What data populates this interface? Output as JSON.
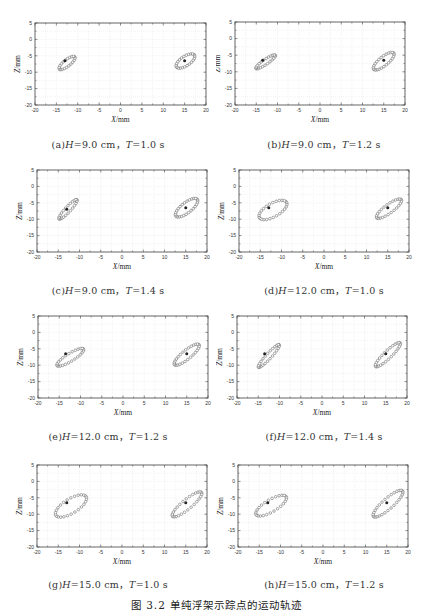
{
  "figure": {
    "caption": "图 3.2   单纯浮架示踪点的运动轨迹"
  },
  "chart_data": [
    {
      "id": "a",
      "type": "scatter",
      "label_prefix": "(a)",
      "H": "9.0 cm",
      "T": "1.0 s",
      "caption": "(a)H=9.0 cm, T=1.0 s",
      "xlabel": "X/mm",
      "ylabel": "Z/mm",
      "xlim": [
        -20,
        20
      ],
      "ylim": [
        -20,
        5
      ],
      "xticks": [
        -20,
        -15,
        -10,
        -5,
        0,
        5,
        10,
        15,
        20
      ],
      "yticks": [
        5,
        0,
        -5,
        -10,
        -15,
        -20
      ],
      "grid": true,
      "center_points": [
        [
          -13,
          -6.5
        ],
        [
          15,
          -6.5
        ]
      ],
      "series": [
        {
          "name": "left-trajectory",
          "loop": {
            "cx": -12.5,
            "cy": -7.2,
            "rx": 2.6,
            "ry": 0.9,
            "angle": -48,
            "n": 22
          }
        },
        {
          "name": "right-trajectory",
          "loop": {
            "cx": 15.2,
            "cy": -6.6,
            "rx": 2.8,
            "ry": 1.3,
            "angle": -45,
            "n": 24
          }
        }
      ]
    },
    {
      "id": "b",
      "type": "scatter",
      "label_prefix": "(b)",
      "H": "9.0 cm",
      "T": "1.2 s",
      "caption": "(b)H=9.0 cm, T=1.2 s",
      "xlabel": "X/mm",
      "ylabel": "Z/mm",
      "xlim": [
        -20,
        20
      ],
      "ylim": [
        -20,
        5
      ],
      "xticks": [
        -20,
        -15,
        -10,
        -5,
        0,
        5,
        10,
        15,
        20
      ],
      "yticks": [
        5,
        0,
        -5,
        -10,
        -15,
        -20
      ],
      "grid": true,
      "center_points": [
        [
          -13.5,
          -6.5
        ],
        [
          15,
          -6.5
        ]
      ],
      "series": [
        {
          "name": "left-trajectory",
          "loop": {
            "cx": -12.8,
            "cy": -7.0,
            "rx": 3.0,
            "ry": 0.7,
            "angle": -42,
            "n": 24
          }
        },
        {
          "name": "right-trajectory",
          "loop": {
            "cx": 15.0,
            "cy": -6.8,
            "rx": 3.4,
            "ry": 1.2,
            "angle": -48,
            "n": 26
          }
        }
      ]
    },
    {
      "id": "c",
      "type": "scatter",
      "label_prefix": "(c)",
      "H": "9.0 cm",
      "T": "1.4 s",
      "caption": "(c)H=9.0 cm, T=1.4 s",
      "xlabel": "X/mm",
      "ylabel": "Z/mm",
      "xlim": [
        -20,
        20
      ],
      "ylim": [
        -20,
        5
      ],
      "xticks": [
        -20,
        -15,
        -10,
        -5,
        0,
        5,
        10,
        15,
        20
      ],
      "yticks": [
        5,
        0,
        -5,
        -10,
        -15,
        -20
      ],
      "grid": true,
      "center_points": [
        [
          -13,
          -7
        ],
        [
          15,
          -6.5
        ]
      ],
      "series": [
        {
          "name": "left-trajectory",
          "loop": {
            "cx": -12.7,
            "cy": -7.0,
            "rx": 3.6,
            "ry": 0.7,
            "angle": -55,
            "n": 24
          }
        },
        {
          "name": "right-trajectory",
          "loop": {
            "cx": 15.2,
            "cy": -6.5,
            "rx": 3.6,
            "ry": 1.4,
            "angle": -48,
            "n": 28
          }
        }
      ]
    },
    {
      "id": "d",
      "type": "scatter",
      "label_prefix": "(d)",
      "H": "12.0 cm",
      "T": "1.0 s",
      "caption": "(d)H=12.0 cm, T=1.0 s",
      "xlabel": "X/mm",
      "ylabel": "Z/mm",
      "xlim": [
        -20,
        20
      ],
      "ylim": [
        -20,
        5
      ],
      "xticks": [
        -20,
        -15,
        -10,
        -5,
        0,
        5,
        10,
        15,
        20
      ],
      "yticks": [
        5,
        0,
        -5,
        -10,
        -15,
        -20
      ],
      "grid": true,
      "center_points": [
        [
          -13,
          -6.5
        ],
        [
          15,
          -6.5
        ]
      ],
      "series": [
        {
          "name": "left-trajectory",
          "loop": {
            "cx": -12.0,
            "cy": -7.2,
            "rx": 4.0,
            "ry": 1.9,
            "angle": -40,
            "n": 26
          }
        },
        {
          "name": "right-trajectory",
          "loop": {
            "cx": 15.3,
            "cy": -6.8,
            "rx": 4.0,
            "ry": 1.2,
            "angle": -45,
            "n": 26
          }
        }
      ]
    },
    {
      "id": "e",
      "type": "scatter",
      "label_prefix": "(e)",
      "H": "12.0 cm",
      "T": "1.2 s",
      "caption": "(e)H=12.0 cm, T=1.2 s",
      "xlabel": "X/mm",
      "ylabel": "Z/mm",
      "xlim": [
        -20,
        20
      ],
      "ylim": [
        -20,
        5
      ],
      "xticks": [
        -20,
        -15,
        -10,
        -5,
        0,
        5,
        10,
        15,
        20
      ],
      "yticks": [
        5,
        0,
        -5,
        -10,
        -15,
        -20
      ],
      "grid": true,
      "center_points": [
        [
          -13.5,
          -6.5
        ],
        [
          15,
          -6.5
        ]
      ],
      "series": [
        {
          "name": "left-trajectory",
          "loop": {
            "cx": -12.4,
            "cy": -7.6,
            "rx": 4.0,
            "ry": 1.1,
            "angle": -40,
            "n": 26
          }
        },
        {
          "name": "right-trajectory",
          "loop": {
            "cx": 15.0,
            "cy": -6.8,
            "rx": 4.2,
            "ry": 1.2,
            "angle": -48,
            "n": 28
          }
        }
      ]
    },
    {
      "id": "f",
      "type": "scatter",
      "label_prefix": "(f)",
      "H": "12.0 cm",
      "T": "1.4 s",
      "caption": "(f)H=12.0 cm, T=1.4 s",
      "xlabel": "X/mm",
      "ylabel": "Z/mm",
      "xlim": [
        -20,
        20
      ],
      "ylim": [
        -20,
        5
      ],
      "xticks": [
        -20,
        -15,
        -10,
        -5,
        0,
        5,
        10,
        15,
        20
      ],
      "yticks": [
        5,
        0,
        -5,
        -10,
        -15,
        -20
      ],
      "grid": true,
      "center_points": [
        [
          -13.5,
          -6.5
        ],
        [
          15,
          -6.5
        ]
      ],
      "series": [
        {
          "name": "left-trajectory",
          "loop": {
            "cx": -12.5,
            "cy": -7.2,
            "rx": 4.2,
            "ry": 0.7,
            "angle": -55,
            "n": 26
          }
        },
        {
          "name": "right-trajectory",
          "loop": {
            "cx": 15.5,
            "cy": -6.8,
            "rx": 4.6,
            "ry": 1.0,
            "angle": -52,
            "n": 28
          }
        }
      ]
    },
    {
      "id": "g",
      "type": "scatter",
      "label_prefix": "(g)",
      "H": "15.0 cm",
      "T": "1.0 s",
      "caption": "(g)H=15.0 cm, T=1.0 s",
      "xlabel": "X/mm",
      "ylabel": "Z/mm",
      "xlim": [
        -20,
        20
      ],
      "ylim": [
        -20,
        5
      ],
      "xticks": [
        -20,
        -15,
        -10,
        -5,
        0,
        5,
        10,
        15,
        20
      ],
      "yticks": [
        5,
        0,
        -5,
        -10,
        -15,
        -20
      ],
      "grid": true,
      "center_points": [
        [
          -13,
          -6.5
        ],
        [
          15,
          -6.5
        ]
      ],
      "series": [
        {
          "name": "left-trajectory",
          "loop": {
            "cx": -12.0,
            "cy": -7.5,
            "rx": 4.6,
            "ry": 2.0,
            "angle": -42,
            "n": 26
          }
        },
        {
          "name": "right-trajectory",
          "loop": {
            "cx": 15.3,
            "cy": -7.0,
            "rx": 5.0,
            "ry": 1.3,
            "angle": -48,
            "n": 28
          }
        }
      ]
    },
    {
      "id": "h",
      "type": "scatter",
      "label_prefix": "(h)",
      "H": "15.0 cm",
      "T": "1.2 s",
      "caption": "(h)H=15.0 cm, T=1.2 s",
      "xlabel": "X/mm",
      "ylabel": "Z/mm",
      "xlim": [
        -20,
        20
      ],
      "ylim": [
        -20,
        5
      ],
      "xticks": [
        -20,
        -15,
        -10,
        -5,
        0,
        5,
        10,
        15,
        20
      ],
      "yticks": [
        5,
        0,
        -5,
        -10,
        -15,
        -20
      ],
      "grid": true,
      "center_points": [
        [
          -13,
          -6.5
        ],
        [
          15,
          -6.5
        ]
      ],
      "series": [
        {
          "name": "left-trajectory",
          "loop": {
            "cx": -12.2,
            "cy": -7.4,
            "rx": 4.5,
            "ry": 1.7,
            "angle": -40,
            "n": 26
          }
        },
        {
          "name": "right-trajectory",
          "loop": {
            "cx": 15.3,
            "cy": -6.8,
            "rx": 5.2,
            "ry": 1.4,
            "angle": -50,
            "n": 30
          }
        }
      ]
    }
  ],
  "layout": {
    "panels": [
      {
        "left": 0,
        "top": 0,
        "plot": [
          35,
          23,
          171,
          82
        ],
        "caption_top": 137
      },
      {
        "left": 216,
        "top": 0,
        "plot": [
          19,
          22,
          170,
          83
        ],
        "caption_top": 137
      },
      {
        "left": 0,
        "top": 148,
        "plot": [
          37,
          22,
          170,
          82
        ],
        "caption_top": 135
      },
      {
        "left": 216,
        "top": 148,
        "plot": [
          23,
          22,
          170,
          82
        ],
        "caption_top": 135
      },
      {
        "left": 0,
        "top": 296,
        "plot": [
          38,
          20,
          170,
          82
        ],
        "caption_top": 133
      },
      {
        "left": 216,
        "top": 296,
        "plot": [
          21,
          20,
          170,
          82
        ],
        "caption_top": 133
      },
      {
        "left": 0,
        "top": 444,
        "plot": [
          37,
          21,
          170,
          82
        ],
        "caption_top": 133
      },
      {
        "left": 216,
        "top": 444,
        "plot": [
          22,
          21,
          170,
          82
        ],
        "caption_top": 133
      }
    ]
  }
}
